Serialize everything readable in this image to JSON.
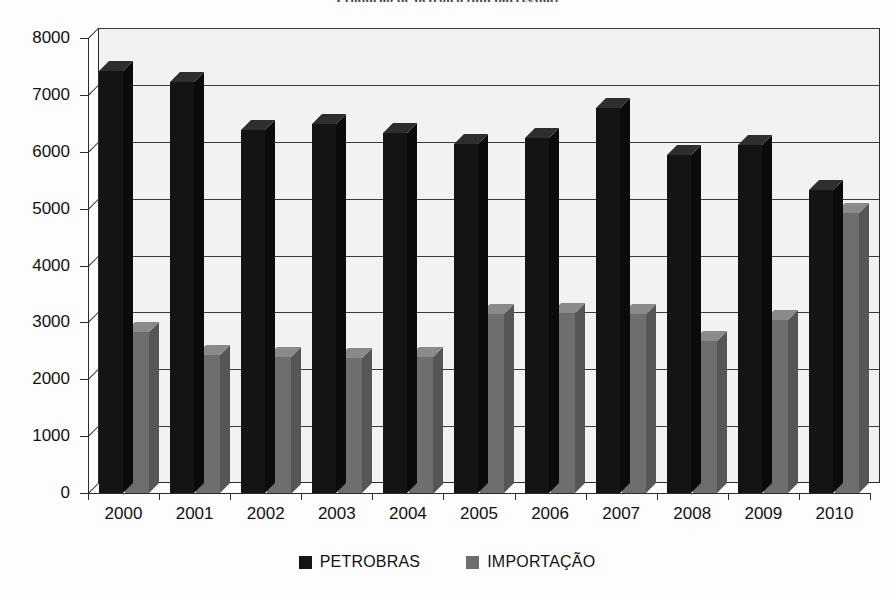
{
  "chart_data": {
    "type": "bar",
    "title": "Produção de petróleo (mil barris/dia)",
    "subtitle": "",
    "xlabel": "",
    "ylabel": "",
    "categories": [
      "2000",
      "2001",
      "2002",
      "2003",
      "2004",
      "2005",
      "2006",
      "2007",
      "2008",
      "2009",
      "2010"
    ],
    "series": [
      {
        "name": "PETROBRAS",
        "color": "#141414",
        "values": [
          7420,
          7230,
          6380,
          6490,
          6330,
          6130,
          6250,
          6770,
          5940,
          6120,
          5320
        ]
      },
      {
        "name": "IMPORTAÇÃO",
        "color": "#6e6e6e",
        "values": [
          2830,
          2420,
          2400,
          2370,
          2400,
          3150,
          3160,
          3150,
          2680,
          3050,
          4930
        ]
      }
    ],
    "yticks": [
      0,
      1000,
      2000,
      3000,
      4000,
      5000,
      6000,
      7000,
      8000
    ],
    "ytick_labels": [
      "0",
      "1000",
      "2000",
      "3000",
      "4000",
      "5000",
      "6000",
      "7000",
      "8000"
    ],
    "ylim": [
      0,
      8000
    ],
    "grid": true,
    "legend_position": "bottom",
    "style": "3d-grouped-bars"
  },
  "legend": {
    "items": [
      {
        "label": "PETROBRAS",
        "swatch": "legend-swatch-black"
      },
      {
        "label": "IMPORTAÇÃO",
        "swatch": "legend-swatch-gray"
      }
    ]
  }
}
